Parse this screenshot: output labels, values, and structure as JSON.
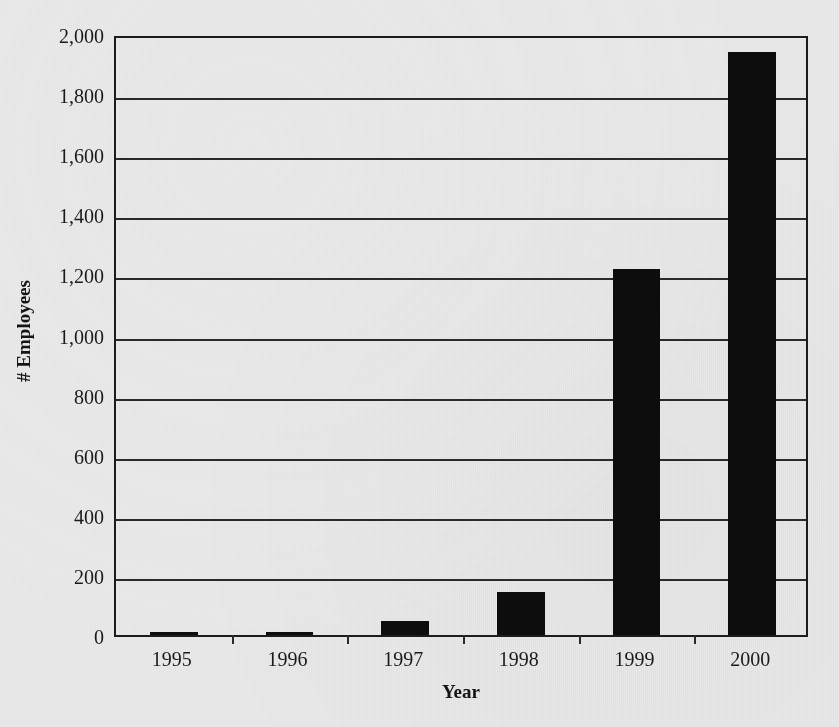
{
  "figure": {
    "background_color": "#e9e9e9",
    "bar_color": "#0d0d0d",
    "axis_color": "#1c1c1c"
  },
  "chart_data": {
    "type": "bar",
    "title": "",
    "xlabel": "Year",
    "ylabel": "# Employees",
    "categories": [
      "1995",
      "1996",
      "1997",
      "1998",
      "1999",
      "2000"
    ],
    "values": [
      8,
      11,
      47,
      143,
      1218,
      1940
    ],
    "ylim": [
      0,
      2000
    ],
    "xlim_categories": 6,
    "ytick_labels": [
      "0",
      "200",
      "400",
      "600",
      "800",
      "1,000",
      "1,200",
      "1,400",
      "1,600",
      "1,800",
      "2,000"
    ],
    "ytick_values": [
      0,
      200,
      400,
      600,
      800,
      1000,
      1200,
      1400,
      1600,
      1800,
      2000
    ],
    "grid": "horizontal",
    "legend": "none",
    "bar_width_fraction": 0.41,
    "series": [
      {
        "name": "# Employees",
        "values": [
          8,
          11,
          47,
          143,
          1218,
          1940
        ]
      }
    ]
  }
}
